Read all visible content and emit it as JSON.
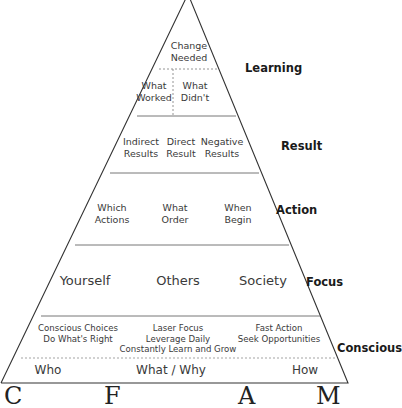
{
  "diagram": {
    "type": "pyramid",
    "levels": [
      {
        "id": "learning",
        "label": "Learning",
        "rows": [
          {
            "cells": [
              "Change\nNeeded"
            ]
          },
          {
            "cells": [
              "What\nWorked",
              "What\nDidn't"
            ]
          }
        ]
      },
      {
        "id": "result",
        "label": "Result",
        "cells": [
          "Indirect\nResults",
          "Direct\nResult",
          "Negative\nResults"
        ]
      },
      {
        "id": "action",
        "label": "Action",
        "cells": [
          "Which\nActions",
          "What\nOrder",
          "When\nBegin"
        ]
      },
      {
        "id": "focus",
        "label": "Focus",
        "cells": [
          "Yourself",
          "Others",
          "Society"
        ]
      },
      {
        "id": "conscious",
        "label": "Conscious",
        "rows": [
          {
            "cells": [
              "Conscious Choices\nDo What's Right",
              "Laser Focus\nLeverage Daily\nConstantly Learn and Grow",
              "Fast Action\nSeek Opportunities"
            ]
          },
          {
            "cells": [
              "Who",
              "What / Why",
              "How"
            ]
          }
        ]
      }
    ],
    "bottom_cutoff_letters": [
      "C",
      "F",
      "A",
      "M"
    ],
    "colors": {
      "line": "#333333",
      "text": "#3a3a3a",
      "label": "#1a1a1a",
      "background": "#ffffff"
    }
  }
}
